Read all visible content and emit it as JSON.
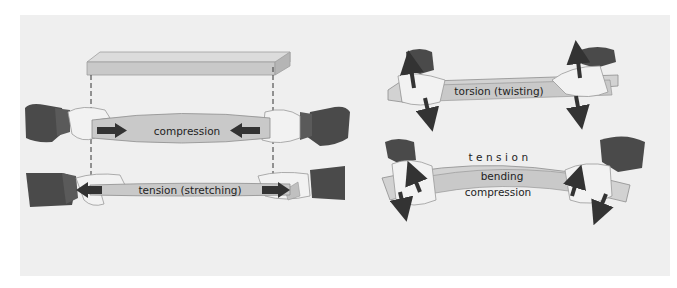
{
  "figure": {
    "panels": [
      {
        "id": "compression",
        "label": "compression",
        "description": "Two hands push the ends of a bar inward; arrows point toward center"
      },
      {
        "id": "tension",
        "label": "tension (stretching)",
        "description": "Two hands pull the ends of a bar outward; arrows point away from center"
      },
      {
        "id": "torsion",
        "label": "torsion (twisting)",
        "description": "Two hands twist a bar in opposite directions; up/down arrows at each end"
      },
      {
        "id": "bending",
        "label_top": "tension",
        "label_middle": "bending",
        "label_bottom": "compression",
        "description": "Two hands bend a bar into an arc; tension on the outer side, compression on the inner side"
      }
    ],
    "reference_plank": {
      "description": "Unstressed plank shown above with dashed guide lines to the compression and tension bars"
    }
  },
  "colors": {
    "background": "#ffffff",
    "panel": "#efefef",
    "wood_face": "#c9c9c9",
    "wood_top": "#dcdcdc",
    "wood_edge": "#9e9e9e",
    "sleeve": "#4a4a4a",
    "cuff": "#5a5a5a",
    "hand": "#f2f2f2",
    "arrow": "#333333",
    "label": "#1e1e1e"
  }
}
